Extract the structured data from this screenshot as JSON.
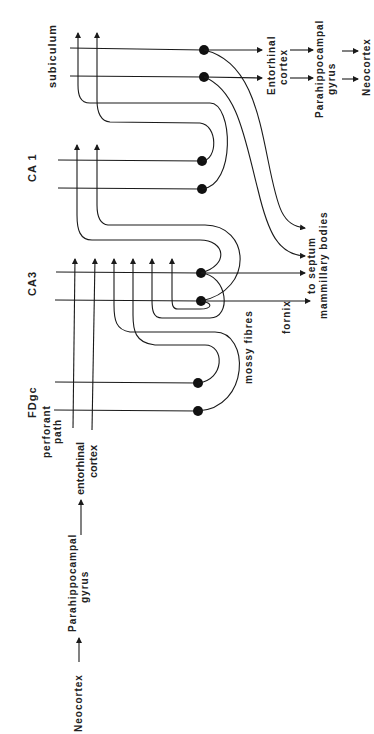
{
  "diagram": {
    "regions": {
      "subiculum": "subiculum",
      "ca1": "CA 1",
      "ca3": "CA3",
      "fdgc": "FDgc"
    },
    "pathways": {
      "perforant_path_1": "perforant",
      "perforant_path_2": "path",
      "entorhinal_in_1": "entorhinal",
      "entorhinal_in_2": "cortex",
      "mossy_fibres": "mossy fibres",
      "fornix": "fornix",
      "to_septum": "to septum",
      "mammillary_bodies": "mammillary bodies"
    },
    "input_chain": {
      "neocortex": "Neocortex",
      "parahippocampal_1": "Parahippocampal",
      "parahippocampal_2": "gyrus"
    },
    "output_chain": {
      "entorhinal_1": "Entorhinal",
      "entorhinal_2": "cortex",
      "parahippocampal_1": "Parahippocampal",
      "parahippocampal_2": "gyrus",
      "neocortex": "Neocortex"
    },
    "colors": {
      "ink": "#1a1a1a",
      "background": "#ffffff"
    }
  }
}
